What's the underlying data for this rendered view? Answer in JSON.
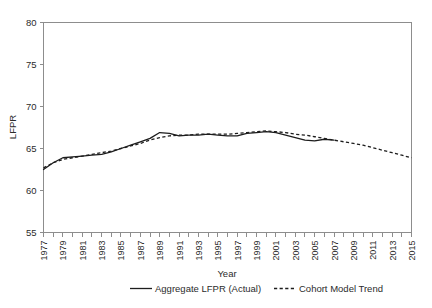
{
  "chart_data": {
    "type": "line",
    "title": "",
    "xlabel": "Year",
    "ylabel": "LFPR",
    "xlim": [
      1977,
      2015
    ],
    "ylim": [
      55,
      80
    ],
    "yticks": [
      55,
      60,
      65,
      70,
      75,
      80
    ],
    "ytick_labels": [
      "55",
      "60",
      "65",
      "70",
      "75",
      "80"
    ],
    "xtick_labels": [
      "1977",
      "1979",
      "1981",
      "1983",
      "1985",
      "1987",
      "1989",
      "1991",
      "1993",
      "1995",
      "1997",
      "1999",
      "2001",
      "2003",
      "2005",
      "2007",
      "2009",
      "2011",
      "2013",
      "2015"
    ],
    "x": [
      1977,
      1978,
      1979,
      1980,
      1981,
      1982,
      1983,
      1984,
      1985,
      1986,
      1987,
      1988,
      1989,
      1990,
      1991,
      1992,
      1993,
      1994,
      1995,
      1996,
      1997,
      1998,
      1999,
      2000,
      2001,
      2002,
      2003,
      2004,
      2005,
      2006,
      2007,
      2008,
      2009,
      2010,
      2011,
      2012,
      2013,
      2014,
      2015
    ],
    "grid": false,
    "legend_position": "bottom",
    "series": [
      {
        "name": "Aggregate LFPR (Actual)",
        "style": "solid",
        "color": "#1d1d1d",
        "values": [
          62.5,
          63.3,
          63.9,
          64.0,
          64.1,
          64.2,
          64.3,
          64.6,
          65.0,
          65.4,
          65.8,
          66.2,
          66.9,
          66.8,
          66.5,
          66.6,
          66.6,
          66.7,
          66.6,
          66.5,
          66.5,
          66.8,
          66.9,
          67.0,
          66.9,
          66.6,
          66.3,
          66.0,
          65.9,
          66.1,
          66.0,
          null,
          null,
          null,
          null,
          null,
          null,
          null,
          null
        ]
      },
      {
        "name": "Cohort Model Trend",
        "style": "dashed",
        "color": "#1d1d1d",
        "values": [
          62.7,
          63.3,
          63.7,
          63.9,
          64.1,
          64.3,
          64.5,
          64.7,
          65.0,
          65.3,
          65.6,
          66.0,
          66.3,
          66.5,
          66.6,
          66.6,
          66.7,
          66.7,
          66.7,
          66.7,
          66.8,
          66.9,
          67.0,
          67.1,
          67.0,
          66.9,
          66.7,
          66.6,
          66.4,
          66.2,
          66.0,
          65.8,
          65.6,
          65.4,
          65.1,
          64.8,
          64.5,
          64.2,
          63.9
        ]
      }
    ]
  },
  "legend": {
    "items": [
      {
        "label": "Aggregate LFPR (Actual)",
        "style": "solid"
      },
      {
        "label": "Cohort Model Trend",
        "style": "dashed"
      }
    ]
  },
  "cut_off_header": " "
}
